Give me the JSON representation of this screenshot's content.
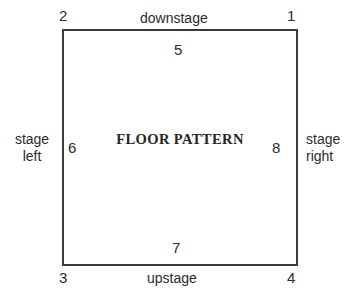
{
  "diagram": {
    "center_label": "FLOOR PATTERN",
    "line_color": "#3a3a3a",
    "text_color": "#2b2b2b",
    "background_color": "#ffffff",
    "corners": [
      {
        "number": "1",
        "position": "top-right"
      },
      {
        "number": "2",
        "position": "top-left"
      },
      {
        "number": "3",
        "position": "bottom-left"
      },
      {
        "number": "4",
        "position": "bottom-right"
      }
    ],
    "edges": [
      {
        "number": "5",
        "position": "top",
        "name": "downstage"
      },
      {
        "number": "6",
        "position": "left",
        "name": "stage left"
      },
      {
        "number": "7",
        "position": "bottom",
        "name": "upstage"
      },
      {
        "number": "8",
        "position": "right",
        "name": "stage right"
      }
    ],
    "edge_labels": {
      "downstage": "downstage",
      "upstage": "upstage",
      "stage_left_line1": "stage",
      "stage_left_line2": "left",
      "stage_right_line1": "stage",
      "stage_right_line2": "right"
    }
  }
}
